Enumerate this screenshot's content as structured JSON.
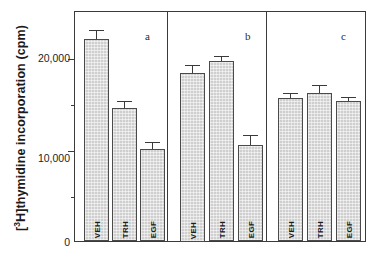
{
  "figure": {
    "y_axis_title_html": "[<sup>3</sup>H]thymidine  incorporation  (cpm)",
    "y_axis_title_text": "[3H]thymidine incorporation (cpm)"
  },
  "axis": {
    "tick_labels": [
      "20,000",
      "10,000",
      "0"
    ],
    "tick_values": [
      20000,
      10000,
      0
    ],
    "minor_tick_values": [
      15000,
      5000
    ]
  },
  "panels": [
    {
      "label": "a"
    },
    {
      "label": "b"
    },
    {
      "label": "c"
    }
  ],
  "bars": {
    "a": [
      {
        "label": "VEH",
        "value": 22200,
        "error": 1000
      },
      {
        "label": "TRH",
        "value": 14600,
        "error": 800
      },
      {
        "label": "EGF",
        "value": 10100,
        "error": 800
      }
    ],
    "b": [
      {
        "label": "VEH",
        "value": 18500,
        "error": 800
      },
      {
        "label": "TRH",
        "value": 19800,
        "error": 500
      },
      {
        "label": "EGF",
        "value": 10600,
        "error": 1100
      }
    ],
    "c": [
      {
        "label": "VEH",
        "value": 15700,
        "error": 600
      },
      {
        "label": "TRH",
        "value": 16300,
        "error": 900
      },
      {
        "label": "EGF",
        "value": 15400,
        "error": 400
      }
    ]
  },
  "colors": {
    "bar_fill": "#cfcfcf",
    "bar_stroke": "#4a4a4a",
    "axis": "#3a3a3a",
    "text": "#1b1b1b",
    "background": "#ffffff"
  },
  "chart_data": {
    "type": "bar",
    "title": "",
    "xlabel": "",
    "ylabel": "[3H]thymidine incorporation (cpm)",
    "ylim": [
      0,
      25000
    ],
    "yticks": [
      0,
      10000,
      20000
    ],
    "ytick_labels": [
      "0",
      "10,000",
      "20,000"
    ],
    "minor_yticks": [
      5000,
      15000
    ],
    "grid": false,
    "legend": "none",
    "panels": [
      "a",
      "b",
      "c"
    ],
    "categories": [
      "VEH",
      "TRH",
      "EGF"
    ],
    "series": [
      {
        "name": "a",
        "values": [
          22200,
          14600,
          10100
        ],
        "errors": [
          1000,
          800,
          800
        ]
      },
      {
        "name": "b",
        "values": [
          18500,
          19800,
          10600
        ],
        "errors": [
          800,
          500,
          1100
        ]
      },
      {
        "name": "c",
        "values": [
          15700,
          16300,
          15400
        ],
        "errors": [
          600,
          900,
          400
        ]
      }
    ]
  }
}
